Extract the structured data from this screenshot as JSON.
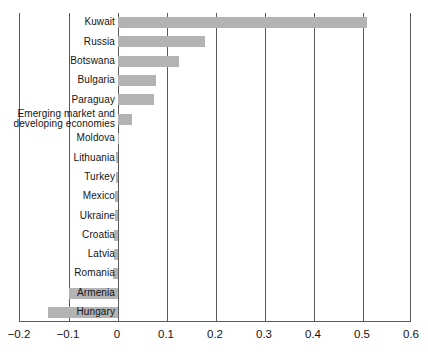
{
  "chart_data": {
    "type": "bar",
    "orientation": "horizontal",
    "title": "",
    "subtitle": "",
    "xlabel": "",
    "ylabel": "",
    "xlim": [
      -0.2,
      0.6
    ],
    "xticks": [
      -0.2,
      -0.1,
      0,
      0.1,
      0.2,
      0.3,
      0.4,
      0.5,
      0.6
    ],
    "xtick_labels": [
      "−0.2",
      "−0.1",
      "0",
      "0.1",
      "0.2",
      "0.3",
      "0.4",
      "0.5",
      "0.6"
    ],
    "grid": true,
    "grid_axis": "x",
    "legend": false,
    "legend_position": "none",
    "bar_color": "#b3b3b3",
    "axis_color": "#5a5a5a",
    "categories": [
      "Kuwait",
      "Russia",
      "Botswana",
      "Bulgaria",
      "Paraguay",
      "Emerging market and\ndeveloping economies",
      "Moldova",
      "Lithuania",
      "Turkey",
      "Mexico",
      "Ukraine",
      "Croatia",
      "Latvia",
      "Romania",
      "Armenia",
      "Hungary"
    ],
    "values": [
      0.508,
      0.177,
      0.124,
      0.077,
      0.074,
      0.029,
      0.002,
      -0.004,
      -0.005,
      -0.006,
      -0.007,
      -0.008,
      -0.009,
      -0.011,
      -0.1,
      -0.143
    ]
  }
}
